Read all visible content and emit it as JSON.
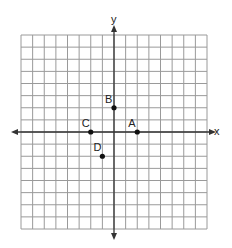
{
  "chart_data": {
    "type": "scatter",
    "title": "",
    "xlabel": "x",
    "ylabel": "y",
    "xlim": [
      -8,
      8
    ],
    "ylim": [
      -8,
      8
    ],
    "grid": true,
    "tick_labels_shown": false,
    "points": [
      {
        "label": "A",
        "x": 2,
        "y": 0
      },
      {
        "label": "B",
        "x": 0,
        "y": 2
      },
      {
        "label": "C",
        "x": -2,
        "y": 0
      },
      {
        "label": "D",
        "x": -1,
        "y": -2
      }
    ]
  },
  "axes": {
    "x_label": "x",
    "y_label": "y"
  },
  "colors": {
    "grid": "#9a9a9a",
    "axis": "#333333",
    "point": "#111111"
  }
}
